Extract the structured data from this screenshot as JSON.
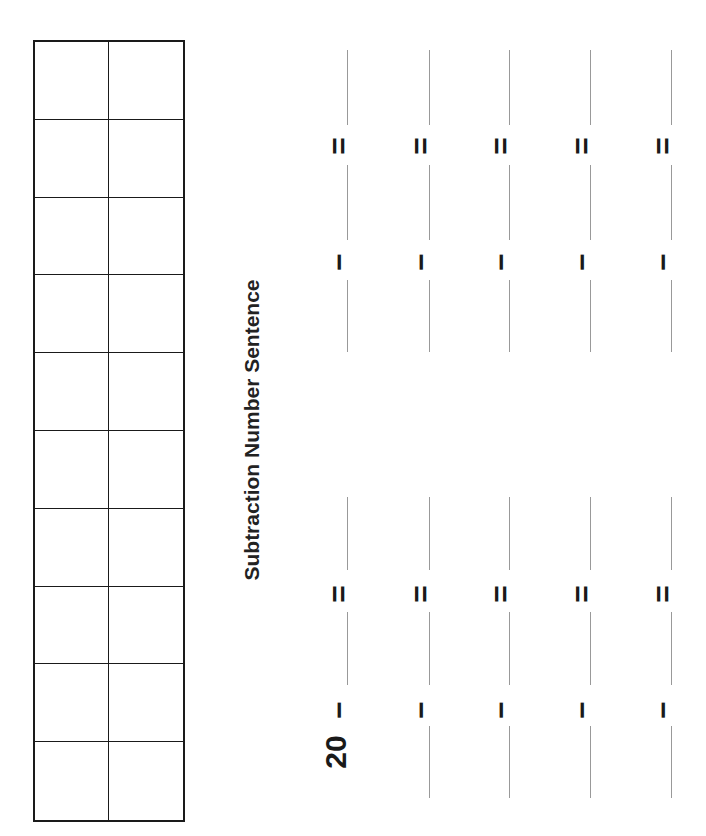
{
  "worksheet": {
    "title": "Subtraction Number Sentence",
    "ten_frame": {
      "columns": 2,
      "rows": 10
    },
    "start_number": "20",
    "minus_symbol": "−",
    "equals_symbol": "=",
    "column_x": [
      347,
      429,
      509,
      590,
      671
    ],
    "problem_rows": [
      {
        "minus_y": 262,
        "equals_y": 146,
        "blanks": [
          [
            50,
            125
          ],
          [
            165,
            240
          ],
          [
            280,
            352
          ]
        ]
      },
      {
        "minus_y": 710,
        "equals_y": 594,
        "blanks": [
          [
            497,
            570
          ],
          [
            612,
            685
          ],
          [
            726,
            798
          ]
        ]
      }
    ]
  }
}
